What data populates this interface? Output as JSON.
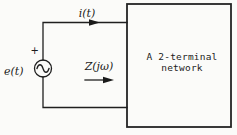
{
  "diagram": {
    "kind": "two-terminal-network-circuit",
    "source_label": "e(t)",
    "source_polarity": "+",
    "current_label": "i(t)",
    "impedance_label": "Z(jω)",
    "box_label_line1": "A 2-terminal",
    "box_label_line2": "network",
    "colors": {
      "ink": "#1c1c1c",
      "paper": "#fbfbf9"
    }
  }
}
